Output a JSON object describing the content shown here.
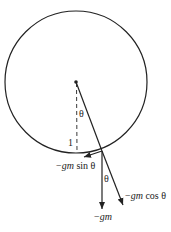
{
  "diagram": {
    "labels": {
      "theta_top": "θ",
      "theta_bottom": "θ",
      "one": "1",
      "tangential_force": {
        "minus": "−",
        "gm": "gm",
        "rest": " sin θ"
      },
      "radial_force": {
        "minus": "−",
        "gm": "gm",
        "rest": " cos θ"
      },
      "gravity": {
        "minus": "−",
        "gm": "gm"
      }
    },
    "colors": {
      "stroke": "#222222",
      "background": "#ffffff"
    }
  }
}
